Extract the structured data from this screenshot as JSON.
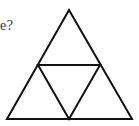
{
  "question": {
    "visible_text_fragment": "e?"
  },
  "figure": {
    "stroke_color": "#111111",
    "stroke_width": 2,
    "outer_triangle": {
      "apex": [
        69,
        10
      ],
      "bottom_left": [
        7,
        119
      ],
      "bottom_right": [
        132,
        119
      ]
    },
    "midpoints": {
      "left": [
        38,
        65
      ],
      "right": [
        100,
        65
      ],
      "bottom": [
        69,
        119
      ]
    },
    "small_triangle_count": 4
  }
}
